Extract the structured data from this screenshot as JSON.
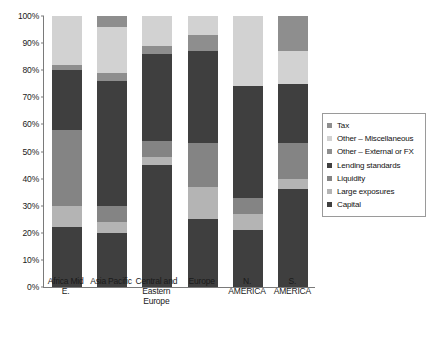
{
  "chart_data": {
    "type": "bar",
    "subtype": "stacked-bar-100-percent",
    "title": "",
    "xlabel": "",
    "ylabel": "",
    "ylim": [
      0,
      100
    ],
    "ytick_labels": [
      "0%",
      "10%",
      "20%",
      "30%",
      "40%",
      "50%",
      "60%",
      "70%",
      "80%",
      "90%",
      "100%"
    ],
    "ytick_values": [
      0,
      10,
      20,
      30,
      40,
      50,
      60,
      70,
      80,
      90,
      100
    ],
    "grid": false,
    "legend_position": "right",
    "categories": [
      "Africa Mid E.",
      "Asia Pacific",
      "Central and\nEastern\nEurope",
      "Europe",
      "N. AMERICA",
      "S. AMERICA"
    ],
    "series": [
      {
        "name": "Capital",
        "color": "#3f3f3f",
        "values": [
          22,
          20,
          45,
          25,
          21,
          36
        ]
      },
      {
        "name": "Large exposures",
        "color": "#b4b4b4",
        "values": [
          8,
          4,
          3,
          12,
          6,
          4
        ]
      },
      {
        "name": "Liquidity",
        "color": "#848484",
        "values": [
          28,
          6,
          6,
          16,
          6,
          13
        ]
      },
      {
        "name": "Lending standards",
        "color": "#3f3f3f",
        "values": [
          22,
          46,
          32,
          34,
          41,
          22
        ]
      },
      {
        "name": "Other – External or FX",
        "color": "#8e8e8e",
        "values": [
          2,
          3,
          3,
          6,
          0,
          0
        ]
      },
      {
        "name": "Other – Miscellaneous",
        "color": "#d2d2d2",
        "values": [
          18,
          17,
          11,
          7,
          26,
          12
        ]
      },
      {
        "name": "Tax",
        "color": "#8e8e8e",
        "values": [
          0,
          4,
          0,
          0,
          0,
          13
        ]
      }
    ]
  },
  "legend": {
    "entries": [
      {
        "label": "Tax",
        "color": "#8e8e8e"
      },
      {
        "label": "Other – Miscellaneous",
        "color": "#d2d2d2"
      },
      {
        "label": "Other – External or FX",
        "color": "#8e8e8e"
      },
      {
        "label": "Lending standards",
        "color": "#3f3f3f"
      },
      {
        "label": "Liquidity",
        "color": "#848484"
      },
      {
        "label": "Large exposures",
        "color": "#b4b4b4"
      },
      {
        "label": "Capital",
        "color": "#3f3f3f"
      }
    ]
  }
}
